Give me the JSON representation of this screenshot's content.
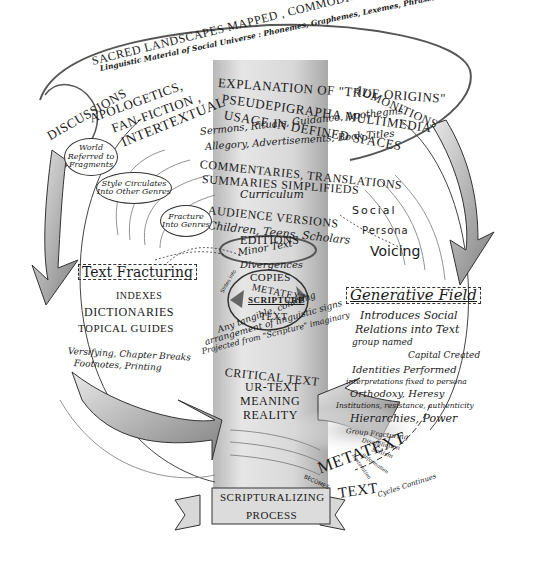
{
  "diagram": {
    "title_banner": {
      "line1": "SCRIPTURALIZING",
      "line2": "PROCESS"
    },
    "top_band": {
      "line1": "SACRED LANDSCAPES MAPPED , COMMODITIES, MARKETS CREATED",
      "line2": "Linguistic Material of Social Universe : Phonemes, Graphemes, Lexemes, Phrases"
    },
    "ribbon_left": [
      "DISCUSSIONS",
      "APOLOGETICS,",
      "FAN-FICTION ,",
      "INTERTEXTUAL"
    ],
    "ribbon_right": [
      "EXPLANATION OF \"TRUE ORIGINS\"",
      "PSEUDEPIGRAPHA MULTIMEDIA",
      "USAGE IN DEFINED SPACES",
      "ADMONITIONS"
    ],
    "uses": {
      "line1": "Sermons, Rituals, Guidance, Apothegms",
      "line2": "Allegory, Advertisements, Book Titles",
      "line3": "COMMENTARIES, TRANSLATIONS",
      "line4": "SUMMARIES SIMPLIFIEDS",
      "line5": "Curriculum"
    },
    "versions": {
      "line1": "AUDIENCE VERSIONS",
      "line2": "Children, Teens, Scholars",
      "line3": "EDITIONS"
    },
    "copies": {
      "line1": "Minor Text",
      "line2": "Divergences",
      "line3": "COPIES"
    },
    "core": {
      "top": "METATEXT",
      "center": "SCRIPTURE",
      "bottom": "TEXT",
      "side": "Slides into"
    },
    "definition": {
      "line1": "Any tangible, cohering",
      "line2": "arrangement of linguistic signs",
      "line3": "Projected from \"Scripture\" imaginary"
    },
    "reality_stack": [
      "CRITICAL TEXT",
      "UR-TEXT",
      "MEANING",
      "REALITY"
    ],
    "bubbles": {
      "world": "World\nReferred to\nFragments",
      "style": "Style Circulates\nInto Other Genres",
      "fracture": "Fracture\nInto Genres"
    },
    "text_fracturing": {
      "heading": "Text Fracturing",
      "items": [
        "INDEXES",
        "DICTIONARIES",
        "TOPICAL GUIDES"
      ],
      "note1": "Versifying, Chapter Breaks",
      "note2": "Footnotes, Printing"
    },
    "social_persona": [
      "Social",
      "Persona",
      "Voicing"
    ],
    "generative_field": {
      "heading": "Generative Field",
      "lines": [
        "Introduces Social",
        "Relations into Text",
        "group named",
        "Capital Created",
        "Identities Performed",
        "interpretations fixed to persona",
        "Orthodoxy, Heresy",
        "Institutions, resistance, authenticity",
        "Hierarchies, Power"
      ]
    },
    "group_fracturing": {
      "heading": "Group Fracturing",
      "items": [
        "Disaffiliation",
        "Schism",
        "Reformation",
        "Restoration"
      ]
    },
    "metatext_bottom": {
      "big": "METATEXT",
      "becomes": "BECOMES",
      "text": "TEXT",
      "cycles": "Cycles Continues"
    },
    "colors": {
      "ink": "#1a1a1a",
      "pillar": "#cfcfcf",
      "arrow": "#9a9a9a",
      "paper": "#ffffff"
    }
  }
}
